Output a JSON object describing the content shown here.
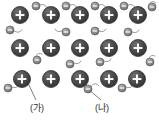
{
  "figure": {
    "title": "",
    "type": "metallic-bonding-lattice-diagram",
    "background_color": "#ffffff",
    "width": 159,
    "height": 121
  },
  "colors": {
    "cation_fill": "#4a4a4a",
    "cation_stroke": "#2e2e2e",
    "cation_highlight": "#8d8d8d",
    "cation_symbol": "#ffffff",
    "electron_fill": "#8c8c8c",
    "electron_stroke": "#5f5f5f",
    "electron_symbol": "#ffffff",
    "trail_stroke": "#9b9b9b",
    "leader_stroke": "#6e6e6e",
    "label_text": "#2b2b2b"
  },
  "legend": {
    "cation_symbol": "+",
    "electron_symbol": "−"
  },
  "labels": [
    {
      "id": "label-ga",
      "text": "(가)",
      "x": 30,
      "y": 104,
      "points_to": "metal-cation",
      "leader": {
        "x1": 27,
        "y1": 81,
        "x2": 36,
        "y2": 100
      }
    },
    {
      "id": "label-na",
      "text": "(나)",
      "x": 95,
      "y": 104,
      "points_to": "free-electron",
      "leader": {
        "x1": 88,
        "y1": 89,
        "x2": 101,
        "y2": 100
      }
    }
  ],
  "cations": [
    {
      "cx": 20,
      "cy": 15,
      "r": 8.5
    },
    {
      "cx": 51,
      "cy": 15,
      "r": 8.5
    },
    {
      "cx": 80,
      "cy": 15,
      "r": 8.5
    },
    {
      "cx": 109,
      "cy": 15,
      "r": 8.5
    },
    {
      "cx": 138,
      "cy": 15,
      "r": 8.5
    },
    {
      "cx": 20,
      "cy": 48,
      "r": 8.5
    },
    {
      "cx": 51,
      "cy": 48,
      "r": 8.5
    },
    {
      "cx": 80,
      "cy": 48,
      "r": 8.5
    },
    {
      "cx": 109,
      "cy": 48,
      "r": 8.5
    },
    {
      "cx": 138,
      "cy": 48,
      "r": 8.5
    },
    {
      "cx": 22,
      "cy": 79,
      "r": 8.5
    },
    {
      "cx": 51,
      "cy": 79,
      "r": 8.5
    },
    {
      "cx": 80,
      "cy": 79,
      "r": 8.5
    },
    {
      "cx": 109,
      "cy": 79,
      "r": 8.5
    },
    {
      "cx": 137,
      "cy": 79,
      "r": 8.5
    }
  ],
  "electrons": [
    {
      "cx": 36,
      "cy": 6,
      "r": 4.0,
      "trail": "M 40 5 q 5 -2 7 3"
    },
    {
      "cx": 66,
      "cy": 6,
      "r": 4.0,
      "trail": "M 70 5 q 5 -2 7 3"
    },
    {
      "cx": 95,
      "cy": 6,
      "r": 4.0,
      "trail": "M 99 5 q 5 -2 7 3"
    },
    {
      "cx": 124,
      "cy": 6,
      "r": 4.0,
      "trail": "M 128 5 q 5 -2 7 3"
    },
    {
      "cx": 152,
      "cy": 7,
      "r": 4.0,
      "trail": "M 150 3 q 3 -3 6 0"
    },
    {
      "cx": 10,
      "cy": 30,
      "r": 4.0,
      "trail": "M 14 31 q 5 3 8 -1"
    },
    {
      "cx": 66,
      "cy": 32,
      "r": 4.0,
      "trail": "M 62 31 q -5 2 -7 -2"
    },
    {
      "cx": 95,
      "cy": 31,
      "r": 4.0,
      "trail": "M 99 31 q 5 2 7 -2"
    },
    {
      "cx": 128,
      "cy": 32,
      "r": 4.0,
      "trail": "M 132 32 q 5 2 7 -2"
    },
    {
      "cx": 37,
      "cy": 60,
      "r": 4.0,
      "trail": "M 36 56 q 2 -4 6 -2"
    },
    {
      "cx": 70,
      "cy": 64,
      "r": 4.0,
      "trail": "M 74 63 q 5 2 7 -2"
    },
    {
      "cx": 100,
      "cy": 62,
      "r": 4.0,
      "trail": "M 104 61 q 5 2 7 -2"
    },
    {
      "cx": 150,
      "cy": 62,
      "r": 4.0,
      "trail": "M 149 58 q 2 -4 6 -2"
    },
    {
      "cx": 8,
      "cy": 88,
      "r": 4.0,
      "trail": "M 12 87 q 5 2 7 -2"
    },
    {
      "cx": 88,
      "cy": 89,
      "r": 4.0,
      "trail": "M 92 85 q 4 -3 7 1"
    },
    {
      "cx": 122,
      "cy": 88,
      "r": 4.0,
      "trail": "M 126 87 q 5 2 7 -2"
    }
  ]
}
